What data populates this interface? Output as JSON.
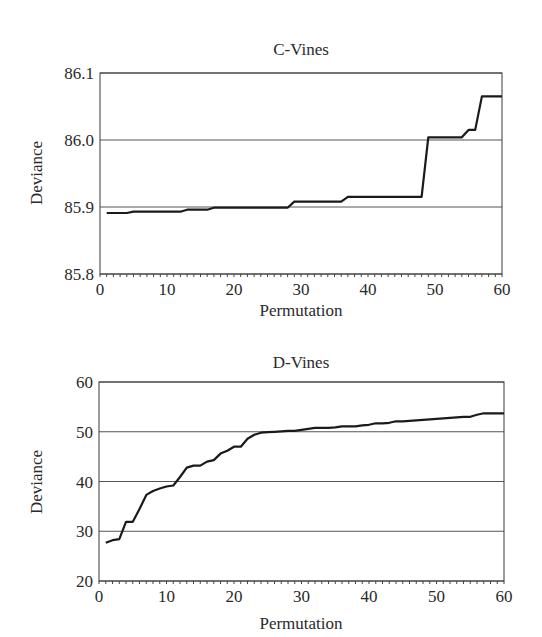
{
  "chart_data": [
    {
      "type": "line",
      "title": "C-Vines",
      "xlabel": "Permutation",
      "ylabel": "Deviance",
      "xlim": [
        0,
        60
      ],
      "ylim": [
        85.8,
        86.1
      ],
      "xticks": [
        0,
        10,
        20,
        30,
        40,
        50,
        60
      ],
      "yticks": [
        85.8,
        85.9,
        86.0,
        86.1
      ],
      "ytick_labels": [
        "85.8",
        "85.9",
        "86.0",
        "86.1"
      ],
      "grid": "horizontal",
      "legend": null,
      "x": [
        1,
        2,
        3,
        4,
        5,
        6,
        7,
        8,
        9,
        10,
        11,
        12,
        13,
        14,
        15,
        16,
        17,
        18,
        19,
        20,
        21,
        22,
        23,
        24,
        25,
        26,
        27,
        28,
        29,
        30,
        31,
        32,
        33,
        34,
        35,
        36,
        37,
        38,
        39,
        40,
        41,
        42,
        43,
        44,
        45,
        46,
        47,
        48,
        49,
        50,
        51,
        52,
        53,
        54,
        55,
        56,
        57,
        58,
        59,
        60
      ],
      "values": [
        85.891,
        85.891,
        85.891,
        85.891,
        85.893,
        85.893,
        85.893,
        85.893,
        85.893,
        85.893,
        85.893,
        85.893,
        85.896,
        85.896,
        85.896,
        85.896,
        85.899,
        85.899,
        85.899,
        85.899,
        85.899,
        85.899,
        85.899,
        85.899,
        85.899,
        85.899,
        85.899,
        85.899,
        85.908,
        85.908,
        85.908,
        85.908,
        85.908,
        85.908,
        85.908,
        85.908,
        85.915,
        85.915,
        85.915,
        85.915,
        85.915,
        85.915,
        85.915,
        85.915,
        85.915,
        85.915,
        85.915,
        85.915,
        86.004,
        86.004,
        86.004,
        86.004,
        86.004,
        86.004,
        86.015,
        86.015,
        86.065,
        86.065,
        86.065,
        86.065
      ]
    },
    {
      "type": "line",
      "title": "D-Vines",
      "xlabel": "Permutation",
      "ylabel": "Deviance",
      "xlim": [
        0,
        60
      ],
      "ylim": [
        20,
        60
      ],
      "xticks": [
        0,
        10,
        20,
        30,
        40,
        50,
        60
      ],
      "yticks": [
        20,
        30,
        40,
        50,
        60
      ],
      "ytick_labels": [
        "20",
        "30",
        "40",
        "50",
        "60"
      ],
      "grid": "horizontal",
      "legend": null,
      "x": [
        1,
        2,
        3,
        4,
        5,
        6,
        7,
        8,
        9,
        10,
        11,
        12,
        13,
        14,
        15,
        16,
        17,
        18,
        19,
        20,
        21,
        22,
        23,
        24,
        25,
        26,
        27,
        28,
        29,
        30,
        31,
        32,
        33,
        34,
        35,
        36,
        37,
        38,
        39,
        40,
        41,
        42,
        43,
        44,
        45,
        46,
        47,
        48,
        49,
        50,
        51,
        52,
        53,
        54,
        55,
        56,
        57,
        58,
        59,
        60
      ],
      "values": [
        27.7,
        28.2,
        28.4,
        31.9,
        31.9,
        34.5,
        37.3,
        38.1,
        38.6,
        39.0,
        39.2,
        40.9,
        42.8,
        43.2,
        43.2,
        44.0,
        44.3,
        45.6,
        46.2,
        47.0,
        47.0,
        48.6,
        49.4,
        49.8,
        49.9,
        50.0,
        50.1,
        50.2,
        50.2,
        50.4,
        50.6,
        50.8,
        50.8,
        50.8,
        50.9,
        51.1,
        51.1,
        51.1,
        51.3,
        51.4,
        51.7,
        51.7,
        51.8,
        52.1,
        52.1,
        52.2,
        52.3,
        52.4,
        52.5,
        52.6,
        52.7,
        52.8,
        52.9,
        53.0,
        53.0,
        53.4,
        53.7,
        53.7,
        53.7,
        53.7
      ]
    }
  ]
}
